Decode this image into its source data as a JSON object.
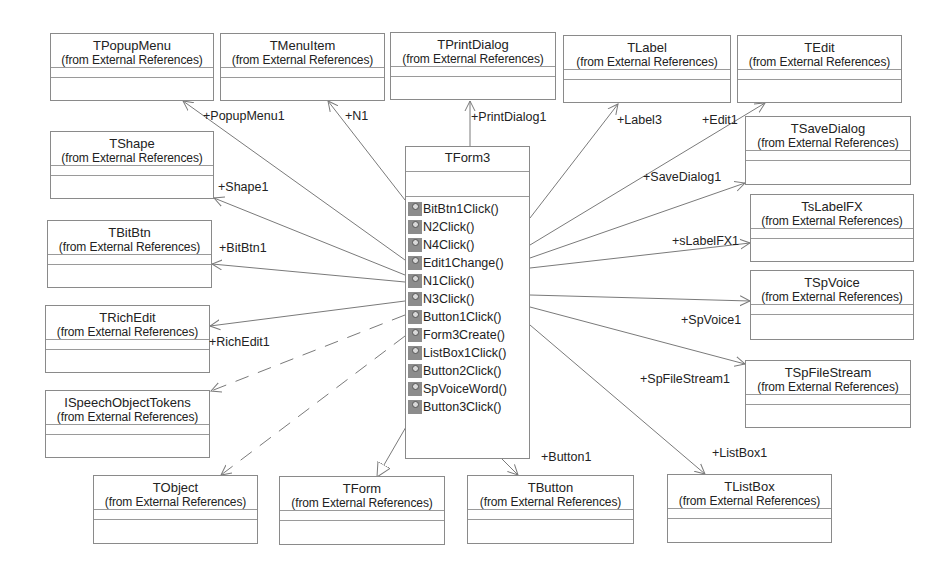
{
  "diagram": {
    "type": "UML class diagram",
    "main_class": {
      "name": "TForm3",
      "operations": [
        "BitBtn1Click()",
        "N2Click()",
        "N4Click()",
        "Edit1Change()",
        "N1Click()",
        "N3Click()",
        "Button1Click()",
        "Form3Create()",
        "ListBox1Click()",
        "Button2Click()",
        "SpVoiceWord()",
        "Button3Click()"
      ]
    },
    "package_note": "(from External References)",
    "classes": {
      "tpopupmenu": {
        "name": "TPopupMenu",
        "pkg": "(from External References)"
      },
      "tmenuitem": {
        "name": "TMenuItem",
        "pkg": "(from External References)"
      },
      "tprintdialog": {
        "name": "TPrintDialog",
        "pkg": "(from External References)"
      },
      "tlabel": {
        "name": "TLabel",
        "pkg": "(from External References)"
      },
      "tedit": {
        "name": "TEdit",
        "pkg": "(from External References)"
      },
      "tshape": {
        "name": "TShape",
        "pkg": "(from External References)"
      },
      "tsavedialog": {
        "name": "TSaveDialog",
        "pkg": "(from External References)"
      },
      "tbitbtn": {
        "name": "TBitBtn",
        "pkg": "(from External References)"
      },
      "tslabelfx": {
        "name": "TsLabelFX",
        "pkg": "(from External References)"
      },
      "trichedit": {
        "name": "TRichEdit",
        "pkg": "(from External References)"
      },
      "tspvoice": {
        "name": "TSpVoice",
        "pkg": "(from External References)"
      },
      "ispeechobjecttokens": {
        "name": "ISpeechObjectTokens",
        "pkg": "(from External References)"
      },
      "tspfilestream": {
        "name": "TSpFileStream",
        "pkg": "(from External References)"
      },
      "tobject": {
        "name": "TObject",
        "pkg": "(from External References)"
      },
      "tform": {
        "name": "TForm",
        "pkg": "(from External References)"
      },
      "tbutton": {
        "name": "TButton",
        "pkg": "(from External References)"
      },
      "tlistbox": {
        "name": "TListBox",
        "pkg": "(from External References)"
      }
    },
    "role_labels": {
      "popupmenu1": "+PopupMenu1",
      "n1": "+N1",
      "printdialog1": "+PrintDialog1",
      "label3": "+Label3",
      "edit1": "+Edit1",
      "shape1": "+Shape1",
      "savedialog1": "+SaveDialog1",
      "bitbtn1": "+BitBtn1",
      "slabelfx1": "+sLabelFX1",
      "richedit1": "+RichEdit1",
      "spvoice1": "+SpVoice1",
      "spfilestream1": "+SpFileStream1",
      "button1": "+Button1",
      "listbox1": "+ListBox1"
    },
    "relationships": [
      {
        "from": "TForm3",
        "to": "TPopupMenu",
        "kind": "association",
        "role": "+PopupMenu1"
      },
      {
        "from": "TForm3",
        "to": "TMenuItem",
        "kind": "association",
        "role": "+N1"
      },
      {
        "from": "TForm3",
        "to": "TPrintDialog",
        "kind": "association",
        "role": "+PrintDialog1"
      },
      {
        "from": "TForm3",
        "to": "TLabel",
        "kind": "association",
        "role": "+Label3"
      },
      {
        "from": "TForm3",
        "to": "TEdit",
        "kind": "association",
        "role": "+Edit1"
      },
      {
        "from": "TForm3",
        "to": "TShape",
        "kind": "association",
        "role": "+Shape1"
      },
      {
        "from": "TForm3",
        "to": "TSaveDialog",
        "kind": "association",
        "role": "+SaveDialog1"
      },
      {
        "from": "TForm3",
        "to": "TBitBtn",
        "kind": "association",
        "role": "+BitBtn1"
      },
      {
        "from": "TForm3",
        "to": "TsLabelFX",
        "kind": "association",
        "role": "+sLabelFX1"
      },
      {
        "from": "TForm3",
        "to": "TRichEdit",
        "kind": "association",
        "role": "+RichEdit1"
      },
      {
        "from": "TForm3",
        "to": "TSpVoice",
        "kind": "association",
        "role": "+SpVoice1"
      },
      {
        "from": "TForm3",
        "to": "TSpFileStream",
        "kind": "association",
        "role": "+SpFileStream1"
      },
      {
        "from": "TForm3",
        "to": "TButton",
        "kind": "association",
        "role": "+Button1"
      },
      {
        "from": "TForm3",
        "to": "TListBox",
        "kind": "association",
        "role": "+ListBox1"
      },
      {
        "from": "TForm3",
        "to": "ISpeechObjectTokens",
        "kind": "dependency"
      },
      {
        "from": "TForm3",
        "to": "TObject",
        "kind": "dependency"
      },
      {
        "from": "TForm3",
        "to": "TForm",
        "kind": "generalization"
      }
    ],
    "colors": {
      "line": "#7a7a7a",
      "border": "#8a8a8a",
      "op_icon": "#8c8c8c"
    }
  }
}
